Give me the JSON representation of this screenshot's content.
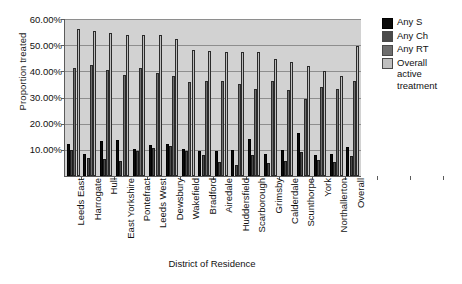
{
  "chart_data": {
    "type": "bar",
    "title": "",
    "xlabel": "District of Residence",
    "ylabel": "Proportion treated",
    "ylim": [
      0,
      60
    ],
    "yticks": [
      0,
      10,
      20,
      30,
      40,
      50,
      60
    ],
    "ytick_labels": [
      "0.00%",
      "10.00%",
      "20.00%",
      "30.00%",
      "40.00%",
      "50.00%",
      "60.00%"
    ],
    "grid": true,
    "legend_position": "right",
    "categories": [
      "Leeds East",
      "Harrogate",
      "Hull",
      "East Yorkshire",
      "Pontefract",
      "Leeds West",
      "Dewsbury",
      "Wakefield",
      "Bradford",
      "Airedale",
      "Huddersfield",
      "Scarborough",
      "Grimsby",
      "Calderdale",
      "Scunthorpe",
      "York",
      "Northallerton",
      "Overall"
    ],
    "series": [
      {
        "name": "Any S",
        "color": "#0b0b0b",
        "values": [
          12.2,
          8.6,
          13.5,
          13.7,
          10.2,
          11.8,
          12.4,
          10.4,
          9.6,
          9.4,
          10.1,
          14.3,
          8.4,
          9.8,
          16.3,
          7.9,
          8.3,
          11.2
        ]
      },
      {
        "name": "Any Ch",
        "color": "#4a4a4a",
        "values": [
          9.8,
          7.0,
          6.6,
          5.6,
          9.4,
          10.8,
          11.6,
          9.4,
          8.2,
          5.4,
          4.2,
          8.0,
          5.0,
          5.9,
          9.2,
          6.0,
          5.2,
          7.6
        ]
      },
      {
        "name": "Any RT",
        "color": "#6e6e6e",
        "values": [
          41.2,
          42.6,
          40.7,
          38.6,
          41.2,
          39.4,
          38.2,
          35.8,
          36.2,
          36.4,
          35.0,
          33.4,
          36.5,
          33.0,
          29.4,
          34.0,
          33.2,
          36.3
        ]
      },
      {
        "name": "Overall active treatment",
        "color": "#bfbfbf",
        "values": [
          56.0,
          55.3,
          54.8,
          54.0,
          53.8,
          53.8,
          52.3,
          48.3,
          47.9,
          47.4,
          47.5,
          47.4,
          44.6,
          43.6,
          42.0,
          40.0,
          38.4,
          49.6
        ]
      }
    ]
  },
  "legend": {
    "entries": [
      {
        "label": "Any S",
        "swatch": "s"
      },
      {
        "label": "Any Ch",
        "swatch": "ch"
      },
      {
        "label": "Any RT",
        "swatch": "rt"
      },
      {
        "label": "Overall\nactive\ntreatment",
        "swatch": "oa"
      }
    ]
  },
  "axes": {
    "y_title": "Proportion treated",
    "x_title": "District of Residence"
  }
}
